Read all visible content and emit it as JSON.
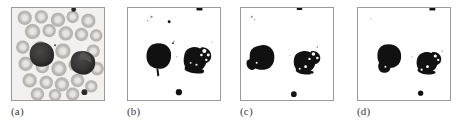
{
  "figure": {
    "type": "micrograph-panel-series",
    "panel_count": 4,
    "background_color": "#ffffff",
    "border_color": "#9a9a9a",
    "panels": [
      {
        "id": "a",
        "caption": "(a)",
        "kind": "grayscale-blood-smear",
        "description": "Original grayscale peripheral blood smear micrograph with many ring-shaped erythrocytes and two dark leukocyte nuclei",
        "colors": {
          "background": "#f2f0ee",
          "erythrocyte_fill": "#c9c6c2",
          "erythrocyte_edge": "#a9a5a1",
          "erythrocyte_center": "#e8e6e3",
          "leukocyte_dark": "#353232",
          "leukocyte_mid": "#4d4a4a",
          "platelet": "#2b2828"
        },
        "erythrocytes": [
          {
            "cx": 13,
            "cy": 10,
            "r": 7.5
          },
          {
            "cx": 30,
            "cy": 9,
            "r": 7.0
          },
          {
            "cx": 47,
            "cy": 12,
            "r": 7.5
          },
          {
            "cx": 62,
            "cy": 9,
            "r": 6.5
          },
          {
            "cx": 78,
            "cy": 13,
            "r": 7.5
          },
          {
            "cx": 21,
            "cy": 24,
            "r": 8.0
          },
          {
            "cx": 38,
            "cy": 23,
            "r": 7.0
          },
          {
            "cx": 55,
            "cy": 26,
            "r": 7.5
          },
          {
            "cx": 71,
            "cy": 27,
            "r": 7.0
          },
          {
            "cx": 85,
            "cy": 28,
            "r": 6.5
          },
          {
            "cx": 11,
            "cy": 40,
            "r": 7.0
          },
          {
            "cx": 29,
            "cy": 41,
            "r": 7.5
          },
          {
            "cx": 52,
            "cy": 44,
            "r": 8.0
          },
          {
            "cx": 83,
            "cy": 44,
            "r": 7.0
          },
          {
            "cx": 14,
            "cy": 57,
            "r": 7.5
          },
          {
            "cx": 31,
            "cy": 60,
            "r": 7.0
          },
          {
            "cx": 48,
            "cy": 62,
            "r": 8.0
          },
          {
            "cx": 64,
            "cy": 58,
            "r": 6.5
          },
          {
            "cx": 86,
            "cy": 62,
            "r": 7.0
          },
          {
            "cx": 18,
            "cy": 74,
            "r": 7.5
          },
          {
            "cx": 35,
            "cy": 76,
            "r": 7.0
          },
          {
            "cx": 51,
            "cy": 78,
            "r": 7.5
          },
          {
            "cx": 67,
            "cy": 74,
            "r": 7.0
          },
          {
            "cx": 80,
            "cy": 80,
            "r": 6.5
          },
          {
            "cx": 26,
            "cy": 88,
            "r": 7.0
          },
          {
            "cx": 44,
            "cy": 89,
            "r": 6.5
          },
          {
            "cx": 62,
            "cy": 88,
            "r": 7.0
          }
        ],
        "leukocytes": [
          {
            "cx": 30,
            "cy": 47,
            "rx": 12,
            "ry": 12,
            "label": "leukocyte-left"
          },
          {
            "cx": 72,
            "cy": 56,
            "rx": 13,
            "ry": 12,
            "label": "leukocyte-right"
          }
        ],
        "platelets": [
          {
            "cx": 74,
            "cy": 86,
            "r": 3.0
          },
          {
            "cx": 63,
            "cy": 2,
            "r": 2.4
          }
        ]
      },
      {
        "id": "b",
        "caption": "(b)",
        "kind": "binary-segmentation",
        "description": "Binary segmentation result: left nucleus solid, right nucleus fragmented with speckle holes, residual noise specks present",
        "colors": {
          "background": "#ffffff",
          "foreground": "#111111",
          "noise": "#8d8d8d"
        },
        "objects": [
          {
            "name": "blob-left",
            "cx": 31,
            "cy": 49,
            "rx": 12.5,
            "ry": 13,
            "solid": true
          },
          {
            "name": "blob-right",
            "cx": 71,
            "cy": 52,
            "rx": 13,
            "ry": 12,
            "solid": false,
            "fragmented": true
          },
          {
            "name": "platelet-bottom",
            "cx": 52,
            "cy": 86,
            "r": 3.2
          },
          {
            "name": "platelet-top",
            "cx": 73,
            "cy": 1,
            "r": 2.6
          },
          {
            "name": "speck-upper-left",
            "cx": 24,
            "cy": 9,
            "r": 1.4
          }
        ]
      },
      {
        "id": "c",
        "caption": "(c)",
        "kind": "binary-segmentation",
        "description": "Binary segmentation result: left nucleus shifted left and lobed, right nucleus thinner and more eroded",
        "colors": {
          "background": "#ffffff",
          "foreground": "#111111",
          "noise": "#8d8d8d"
        },
        "objects": [
          {
            "name": "blob-left",
            "cx": 22,
            "cy": 50,
            "rx": 12,
            "ry": 12.5,
            "solid": true
          },
          {
            "name": "blob-right",
            "cx": 68,
            "cy": 55,
            "rx": 11,
            "ry": 11,
            "solid": false,
            "fragmented": true
          },
          {
            "name": "platelet-bottom",
            "cx": 54,
            "cy": 88,
            "r": 2.8
          },
          {
            "name": "platelet-top",
            "cx": 60,
            "cy": 1,
            "r": 2.6
          },
          {
            "name": "speck-upper-left",
            "cx": 11,
            "cy": 9,
            "r": 1.2
          }
        ]
      },
      {
        "id": "d",
        "caption": "(d)",
        "kind": "binary-segmentation",
        "description": "Binary segmentation result: left nucleus compact and smooth, right nucleus compact with a small notch, least residual noise",
        "colors": {
          "background": "#ffffff",
          "foreground": "#111111",
          "noise": "#8d8d8d"
        },
        "objects": [
          {
            "name": "blob-left",
            "cx": 31,
            "cy": 49,
            "rx": 12,
            "ry": 12,
            "solid": true
          },
          {
            "name": "blob-right",
            "cx": 73,
            "cy": 54,
            "rx": 11,
            "ry": 10.5,
            "solid": false,
            "fragmented": true
          },
          {
            "name": "platelet-bottom",
            "cx": 64,
            "cy": 87,
            "r": 2.6
          },
          {
            "name": "platelet-top",
            "cx": 75,
            "cy": 1,
            "r": 2.6
          }
        ]
      }
    ]
  }
}
